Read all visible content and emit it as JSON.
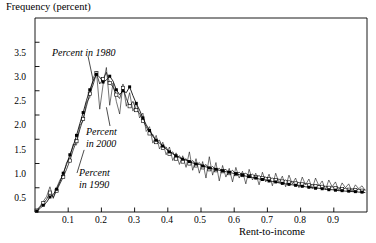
{
  "figure": {
    "width": 376,
    "height": 243,
    "background": "#ffffff",
    "ink_color": "#000000"
  },
  "axes": {
    "y_axis_title": "Frequency (percent)",
    "x_axis_title": "Rent-to-income",
    "y_tick_labels": [
      "0.5",
      "1.0",
      "1.5",
      "2.0",
      "2.5",
      "3.0",
      "3.5"
    ],
    "x_tick_labels": [
      "0.1",
      "0.2",
      "0.3",
      "0.4",
      "0.5",
      "0.6",
      "0.7",
      "0.8",
      "0.9"
    ]
  },
  "annotations": [
    {
      "id": "annot-1980",
      "text": "Percent in 1980",
      "lines": [
        "Percent in 1980"
      ]
    },
    {
      "id": "annot-2000",
      "text": "Percent in 2000",
      "lines": [
        "Percent",
        "in 2000"
      ]
    },
    {
      "id": "annot-1990",
      "text": "Percent in 1990",
      "lines": [
        "Percent",
        "in 1990"
      ]
    }
  ],
  "chart_data": {
    "type": "line",
    "title": "",
    "subtitle": "",
    "xlabel": "Rent-to-income",
    "ylabel": "Frequency (percent)",
    "xlim": [
      0.0,
      1.0
    ],
    "ylim": [
      0.0,
      4.0
    ],
    "xticks": [
      0.1,
      0.2,
      0.3,
      0.4,
      0.5,
      0.6,
      0.7,
      0.8,
      0.9
    ],
    "yticks": [
      0.5,
      1.0,
      1.5,
      2.0,
      2.5,
      3.0,
      3.5
    ],
    "grid": false,
    "legend": "inline-annotations",
    "legend_position": "inside-left",
    "annotations": [
      {
        "label": "Percent in 1980",
        "x": 0.13,
        "y": 3.05,
        "points_to_x": 0.18,
        "points_to_y": 2.72
      },
      {
        "label": "Percent in 2000",
        "x": 0.26,
        "y": 1.62,
        "points_to_x": 0.22,
        "points_to_y": 2.12
      },
      {
        "label": "Percent in 1990",
        "x": 0.23,
        "y": 0.88,
        "points_to_x": 0.145,
        "points_to_y": 1.18
      }
    ],
    "series": [
      {
        "name": "Percent in 1980",
        "marker": "filled-square",
        "x": [
          0.005,
          0.015,
          0.025,
          0.035,
          0.045,
          0.055,
          0.065,
          0.075,
          0.085,
          0.095,
          0.105,
          0.115,
          0.125,
          0.135,
          0.145,
          0.155,
          0.165,
          0.175,
          0.185,
          0.195,
          0.205,
          0.215,
          0.225,
          0.235,
          0.245,
          0.255,
          0.265,
          0.275,
          0.285,
          0.295,
          0.305,
          0.315,
          0.325,
          0.335,
          0.345,
          0.355,
          0.365,
          0.375,
          0.385,
          0.395,
          0.405,
          0.415,
          0.425,
          0.435,
          0.445,
          0.455,
          0.465,
          0.475,
          0.485,
          0.495,
          0.505,
          0.515,
          0.525,
          0.535,
          0.545,
          0.555,
          0.565,
          0.575,
          0.585,
          0.595,
          0.605,
          0.615,
          0.625,
          0.635,
          0.645,
          0.655,
          0.665,
          0.675,
          0.685,
          0.695,
          0.705,
          0.715,
          0.725,
          0.735,
          0.745,
          0.755,
          0.765,
          0.775,
          0.785,
          0.795,
          0.805,
          0.815,
          0.825,
          0.835,
          0.845,
          0.855,
          0.865,
          0.875,
          0.885,
          0.895,
          0.905,
          0.915,
          0.925,
          0.935,
          0.945,
          0.955,
          0.965,
          0.975,
          0.985,
          0.995
        ],
        "y": [
          0.02,
          0.07,
          0.14,
          0.2,
          0.31,
          0.36,
          0.47,
          0.62,
          0.8,
          0.98,
          1.18,
          1.36,
          1.58,
          1.82,
          2.05,
          2.3,
          2.52,
          2.7,
          2.84,
          2.78,
          2.68,
          2.72,
          2.8,
          2.7,
          2.52,
          2.42,
          2.5,
          2.46,
          2.58,
          2.4,
          2.24,
          2.1,
          1.94,
          1.8,
          1.68,
          1.56,
          1.48,
          1.42,
          1.36,
          1.3,
          1.24,
          1.2,
          1.16,
          1.12,
          1.09,
          1.07,
          1.04,
          1.01,
          0.99,
          0.98,
          0.95,
          0.93,
          0.91,
          0.89,
          0.88,
          0.86,
          0.85,
          0.83,
          0.82,
          0.8,
          0.79,
          0.77,
          0.76,
          0.74,
          0.73,
          0.71,
          0.7,
          0.68,
          0.67,
          0.66,
          0.64,
          0.63,
          0.62,
          0.6,
          0.59,
          0.58,
          0.57,
          0.56,
          0.55,
          0.54,
          0.53,
          0.52,
          0.51,
          0.5,
          0.49,
          0.49,
          0.48,
          0.47,
          0.46,
          0.46,
          0.45,
          0.44,
          0.44,
          0.43,
          0.43,
          0.42,
          0.42,
          0.41,
          0.41,
          0.4
        ]
      },
      {
        "name": "Percent in 1990",
        "marker": "open-square",
        "x": [
          0.005,
          0.015,
          0.025,
          0.035,
          0.045,
          0.055,
          0.065,
          0.075,
          0.085,
          0.095,
          0.105,
          0.115,
          0.125,
          0.135,
          0.145,
          0.155,
          0.165,
          0.175,
          0.185,
          0.195,
          0.205,
          0.215,
          0.225,
          0.235,
          0.245,
          0.255,
          0.265,
          0.275,
          0.285,
          0.295,
          0.305,
          0.315,
          0.325,
          0.335,
          0.345,
          0.355,
          0.365,
          0.375,
          0.385,
          0.395,
          0.405,
          0.415,
          0.425,
          0.435,
          0.445,
          0.455,
          0.465,
          0.475,
          0.485,
          0.495,
          0.505,
          0.515,
          0.525,
          0.535,
          0.545,
          0.555,
          0.565,
          0.575,
          0.585,
          0.595,
          0.605,
          0.615,
          0.625,
          0.635,
          0.645,
          0.655,
          0.665,
          0.675,
          0.685,
          0.695,
          0.705,
          0.715,
          0.725,
          0.735,
          0.745,
          0.755,
          0.765,
          0.775,
          0.785,
          0.795,
          0.805,
          0.815,
          0.825,
          0.835,
          0.845,
          0.855,
          0.865,
          0.875,
          0.885,
          0.895,
          0.905,
          0.915,
          0.925,
          0.935,
          0.945,
          0.955,
          0.965,
          0.975,
          0.985,
          0.995
        ],
        "y": [
          0.03,
          0.1,
          0.18,
          0.26,
          0.4,
          0.3,
          0.44,
          0.58,
          0.72,
          0.88,
          1.06,
          1.28,
          1.46,
          1.7,
          1.92,
          2.18,
          2.44,
          2.62,
          2.86,
          2.64,
          2.74,
          2.88,
          2.66,
          2.58,
          2.42,
          2.34,
          2.56,
          2.34,
          2.18,
          2.28,
          2.1,
          2.04,
          1.88,
          1.76,
          1.62,
          1.6,
          1.44,
          1.48,
          1.32,
          1.34,
          1.2,
          1.24,
          1.1,
          1.16,
          1.04,
          1.1,
          1.0,
          1.06,
          0.96,
          1.02,
          0.92,
          0.98,
          0.88,
          0.94,
          0.86,
          0.9,
          0.84,
          0.88,
          0.8,
          0.86,
          0.78,
          0.82,
          0.76,
          0.8,
          0.74,
          0.78,
          0.72,
          0.75,
          0.7,
          0.72,
          0.68,
          0.7,
          0.66,
          0.68,
          0.63,
          0.66,
          0.61,
          0.63,
          0.59,
          0.61,
          0.57,
          0.59,
          0.55,
          0.57,
          0.53,
          0.55,
          0.52,
          0.53,
          0.5,
          0.52,
          0.49,
          0.5,
          0.47,
          0.49,
          0.46,
          0.48,
          0.45,
          0.47,
          0.44,
          0.46
        ]
      },
      {
        "name": "Percent in 2000",
        "marker": "none",
        "x": [
          0.005,
          0.015,
          0.025,
          0.035,
          0.045,
          0.055,
          0.065,
          0.075,
          0.085,
          0.095,
          0.105,
          0.115,
          0.125,
          0.135,
          0.145,
          0.155,
          0.165,
          0.175,
          0.185,
          0.195,
          0.205,
          0.215,
          0.225,
          0.235,
          0.245,
          0.255,
          0.265,
          0.275,
          0.285,
          0.295,
          0.305,
          0.315,
          0.325,
          0.335,
          0.345,
          0.355,
          0.365,
          0.375,
          0.385,
          0.395,
          0.405,
          0.415,
          0.425,
          0.435,
          0.445,
          0.455,
          0.465,
          0.475,
          0.485,
          0.495,
          0.505,
          0.515,
          0.525,
          0.535,
          0.545,
          0.555,
          0.565,
          0.575,
          0.585,
          0.595,
          0.605,
          0.615,
          0.625,
          0.635,
          0.645,
          0.655,
          0.665,
          0.675,
          0.685,
          0.695,
          0.705,
          0.715,
          0.725,
          0.735,
          0.745,
          0.755,
          0.765,
          0.775,
          0.785,
          0.795,
          0.805,
          0.815,
          0.825,
          0.835,
          0.845,
          0.855,
          0.865,
          0.875,
          0.885,
          0.895,
          0.905,
          0.915,
          0.925,
          0.935,
          0.945,
          0.955,
          0.965,
          0.975,
          0.985,
          0.995
        ],
        "y": [
          0.04,
          0.12,
          0.22,
          0.32,
          0.52,
          0.28,
          0.5,
          0.66,
          0.76,
          1.02,
          1.12,
          1.4,
          1.38,
          1.78,
          1.88,
          2.26,
          2.36,
          2.76,
          2.9,
          2.12,
          2.62,
          2.98,
          2.2,
          2.66,
          2.28,
          2.02,
          2.64,
          2.18,
          2.46,
          2.08,
          2.26,
          1.94,
          2.04,
          1.66,
          1.76,
          1.42,
          1.58,
          1.3,
          1.44,
          1.18,
          1.34,
          1.06,
          1.22,
          0.98,
          1.16,
          0.92,
          1.24,
          0.86,
          1.1,
          0.8,
          1.04,
          0.7,
          1.14,
          0.76,
          1.02,
          0.64,
          0.96,
          0.72,
          0.9,
          0.62,
          0.92,
          0.7,
          0.84,
          0.58,
          0.88,
          0.66,
          0.8,
          0.56,
          0.82,
          0.62,
          0.78,
          0.54,
          0.8,
          0.6,
          0.74,
          0.52,
          0.76,
          0.58,
          0.7,
          0.5,
          0.72,
          0.56,
          0.68,
          0.48,
          0.7,
          0.54,
          0.64,
          0.46,
          0.66,
          0.52,
          0.62,
          0.44,
          0.6,
          0.5,
          0.58,
          0.42,
          0.56,
          0.48,
          0.54,
          0.44
        ]
      }
    ]
  }
}
